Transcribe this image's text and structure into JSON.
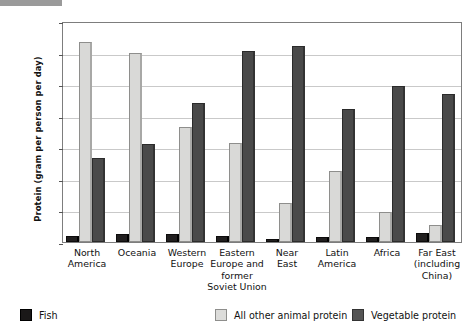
{
  "figure": {
    "top_strip_present": true
  },
  "chart_data": {
    "type": "bar",
    "title": "",
    "xlabel": "",
    "ylabel": "Protein (gram per person per day)",
    "ylim": [
      0,
      70
    ],
    "ytick_labels": [
      "0",
      "10",
      "20",
      "30",
      "40",
      "50",
      "60",
      "70"
    ],
    "ytick_values": [
      0,
      10,
      20,
      30,
      40,
      50,
      60,
      70
    ],
    "grid": true,
    "legend_position": "bottom",
    "categories": [
      "North America",
      "Oceania",
      "Western Europe",
      "Eastern Europe and former Soviet Union",
      "Near East",
      "Latin America",
      "Africa",
      "Far East (including China)"
    ],
    "category_label_lines": [
      [
        "North",
        "America"
      ],
      [
        "Oceania"
      ],
      [
        "Western",
        "Europe"
      ],
      [
        "Eastern",
        "Europe and",
        "former",
        "Soviet Union"
      ],
      [
        "Near",
        "East"
      ],
      [
        "Latin",
        "America"
      ],
      [
        "Africa"
      ],
      [
        "Far East",
        "(including",
        "China)"
      ]
    ],
    "series": [
      {
        "name": "Fish",
        "color": "#211f1f",
        "values": [
          2,
          2.5,
          2.5,
          2,
          1,
          1.5,
          1.5,
          3
        ]
      },
      {
        "name": "All other animal protein",
        "color": "#d9d9d7",
        "values": [
          63.5,
          60,
          36.5,
          31.5,
          12.5,
          22.5,
          9.5,
          5.5
        ]
      },
      {
        "name": "Vegetable protein",
        "color": "#4a4a4a",
        "values": [
          26.5,
          31,
          44,
          60.5,
          62,
          42,
          49.5,
          47
        ]
      }
    ],
    "legend": [
      {
        "label": "Fish",
        "swatch": "fish-swatch"
      },
      {
        "label": "All other animal protein",
        "swatch": "animal-protein-swatch"
      },
      {
        "label": "Vegetable protein",
        "swatch": "vegetable-protein-swatch"
      }
    ]
  }
}
